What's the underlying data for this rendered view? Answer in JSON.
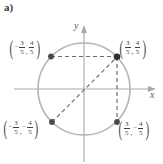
{
  "figure": {
    "part_label": "a)",
    "axes": {
      "x_label": "x",
      "y_label": "y",
      "x_axis_color": "#a8a8aa",
      "y_axis_color": "#a8a8aa"
    },
    "circle": {
      "name": "unit-circle",
      "center_x": 84,
      "center_y": 89,
      "radius": 46,
      "stroke_color": "#b4b4b6"
    },
    "points": [
      {
        "id": "point-top-left",
        "x_text": "3",
        "x_den": "5",
        "x_negative": true,
        "y_text": "4",
        "y_den": "5",
        "y_negative": false,
        "px": 51,
        "py": 56
      },
      {
        "id": "point-top-right",
        "x_text": "3",
        "x_den": "5",
        "x_negative": false,
        "y_text": "4",
        "y_den": "5",
        "y_negative": false,
        "px": 117,
        "py": 57
      },
      {
        "id": "point-bottom-left",
        "x_text": "3",
        "x_den": "5",
        "x_negative": true,
        "y_text": "4",
        "y_den": "5",
        "y_negative": true,
        "px": 52,
        "py": 122
      },
      {
        "id": "point-bottom-right",
        "x_text": "3",
        "x_den": "5",
        "x_negative": false,
        "y_text": "4",
        "y_den": "5",
        "y_negative": true,
        "px": 117,
        "py": 122
      }
    ],
    "connectors": [
      {
        "id": "dashed-horizontal-top",
        "style": "dashed"
      },
      {
        "id": "dashed-vertical-right",
        "style": "dashed"
      },
      {
        "id": "dashed-diagonal",
        "style": "dashed"
      }
    ],
    "colors": {
      "point_fill": "#4a4a4c",
      "dash": "#6e6e70",
      "axis": "#a8a8aa",
      "circle": "#b4b4b6",
      "text": "#3f3f41"
    }
  }
}
